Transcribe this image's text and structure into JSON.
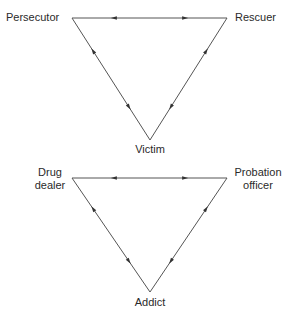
{
  "diagrams": [
    {
      "name": "drama-triangle",
      "nodes": {
        "left": "Persecutor",
        "right": "Rescuer",
        "bottom": "Victim"
      },
      "edges": [
        {
          "from": "left",
          "to": "right",
          "bidirectional": true
        },
        {
          "from": "left",
          "to": "bottom",
          "bidirectional": true
        },
        {
          "from": "right",
          "to": "bottom",
          "bidirectional": true
        }
      ]
    },
    {
      "name": "addiction-triangle",
      "nodes": {
        "left": "Drug dealer",
        "left_lines": [
          "Drug",
          "dealer"
        ],
        "right": "Probation officer",
        "right_lines": [
          "Probation",
          "officer"
        ],
        "bottom": "Addict"
      },
      "edges": [
        {
          "from": "left",
          "to": "right",
          "bidirectional": true
        },
        {
          "from": "left",
          "to": "bottom",
          "bidirectional": true
        },
        {
          "from": "right",
          "to": "bottom",
          "bidirectional": true
        }
      ]
    }
  ],
  "colors": {
    "line": "#555555",
    "text": "#2a2a2a"
  }
}
